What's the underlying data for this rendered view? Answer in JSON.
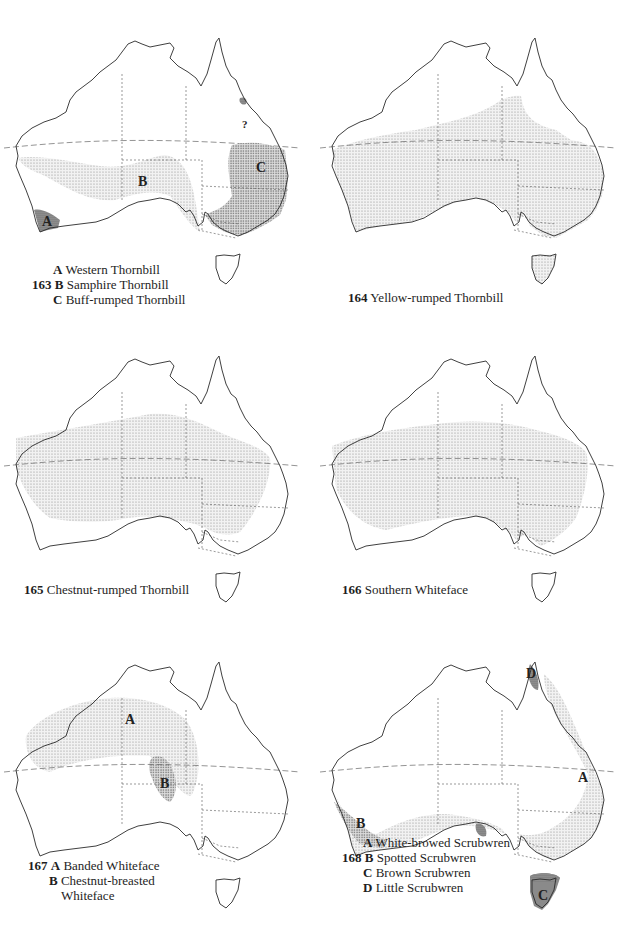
{
  "page": {
    "maps": [
      {
        "id": "163",
        "number": "163",
        "entries": [
          {
            "letter": "A",
            "name": "Western Thornbill"
          },
          {
            "letter": "B",
            "name": "Samphire Thornbill"
          },
          {
            "letter": "C",
            "name": "Buff-rumped Thornbill"
          }
        ],
        "map_labels": [
          "A",
          "B",
          "C",
          "?"
        ]
      },
      {
        "id": "164",
        "number": "164",
        "entries": [
          {
            "letter": "",
            "name": "Yellow-rumped Thornbill"
          }
        ],
        "map_labels": []
      },
      {
        "id": "165",
        "number": "165",
        "entries": [
          {
            "letter": "",
            "name": "Chestnut-rumped Thornbill"
          }
        ],
        "map_labels": []
      },
      {
        "id": "166",
        "number": "166",
        "entries": [
          {
            "letter": "",
            "name": "Southern Whiteface"
          }
        ],
        "map_labels": []
      },
      {
        "id": "167",
        "number": "167",
        "entries": [
          {
            "letter": "A",
            "name": "Banded Whiteface"
          },
          {
            "letter": "B",
            "name": "Chestnut-breasted"
          },
          {
            "letter": "",
            "name": "Whiteface"
          }
        ],
        "map_labels": [
          "A",
          "B"
        ]
      },
      {
        "id": "168",
        "number": "168",
        "entries": [
          {
            "letter": "A",
            "name": "White-browed Scrubwren"
          },
          {
            "letter": "B",
            "name": "Spotted Scrubwren"
          },
          {
            "letter": "C",
            "name": "Brown Scrubwren"
          },
          {
            "letter": "D",
            "name": "Little Scrubwren"
          }
        ],
        "map_labels": [
          "A",
          "B",
          "C",
          "D"
        ]
      }
    ]
  },
  "colors": {
    "outline": "#2a2a2a",
    "light_stipple": "#b8b8b8",
    "dense_stipple": "#7a7a7a",
    "dark_fill": "#6a6a6a"
  }
}
